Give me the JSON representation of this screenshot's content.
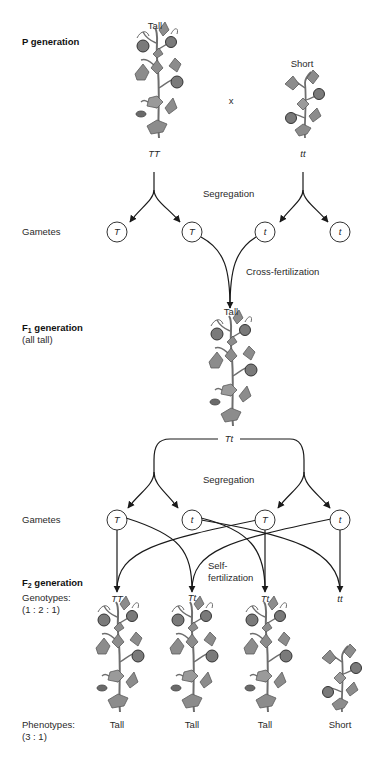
{
  "p_generation": {
    "title": "P generation",
    "parent_tall": {
      "phenotype": "Tall",
      "genotype": "TT"
    },
    "cross_symbol": "x",
    "parent_short": {
      "phenotype": "Short",
      "genotype": "tt"
    }
  },
  "segregation_label_1": "Segregation",
  "gametes_label_1": "Gametes",
  "gametes_1": [
    "T",
    "T",
    "t",
    "t"
  ],
  "cross_fertilization_label": "Cross-fertilization",
  "f1_generation": {
    "title_prefix": "F",
    "title_sub": "1",
    "title_suffix": " generation",
    "subtitle": "(all tall)",
    "phenotype": "Tall",
    "genotype": "Tt"
  },
  "segregation_label_2": "Segregation",
  "gametes_label_2": "Gametes",
  "gametes_2": [
    "T",
    "t",
    "T",
    "t"
  ],
  "self_fertilization_label_line1": "Self-",
  "self_fertilization_label_line2": "fertilization",
  "f2_generation": {
    "title_prefix": "F",
    "title_sub": "2",
    "title_suffix": " generation",
    "genotypes_label": "Genotypes:",
    "genotypes_ratio": "(1 : 2 : 1)",
    "phenotypes_label": "Phenotypes:",
    "phenotypes_ratio": "(3 : 1)",
    "offspring": [
      {
        "genotype": "TT",
        "phenotype": "Tall"
      },
      {
        "genotype": "Tt",
        "phenotype": "Tall"
      },
      {
        "genotype": "Tt",
        "phenotype": "Tall"
      },
      {
        "genotype": "tt",
        "phenotype": "Short"
      }
    ]
  },
  "colors": {
    "line": "#1a1a1a",
    "plant_leaf": "#8c8c8c",
    "plant_dark": "#5a5a5a",
    "plant_stem": "#6e6e6e"
  }
}
